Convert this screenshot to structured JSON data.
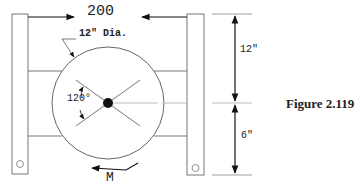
{
  "figure": {
    "caption": "Figure 2.119",
    "force_label": "200",
    "diameter_label": "12\" Dia.",
    "angle_label": "120°",
    "moment_label": "M",
    "dimension_upper": "12\"",
    "dimension_lower": "6\""
  },
  "colors": {
    "line": "#555555",
    "dark": "#111111",
    "background": "#ffffff"
  }
}
